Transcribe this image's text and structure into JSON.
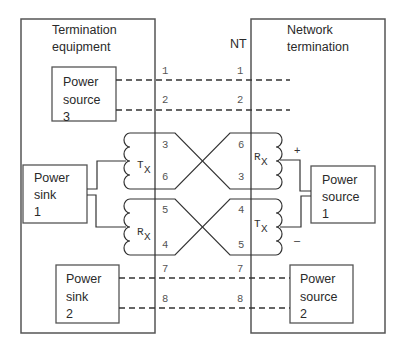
{
  "diagram": {
    "left_box": {
      "title_line1": "Termination",
      "title_line2": "equipment"
    },
    "right_box": {
      "title_line1": "Network",
      "title_line2": "termination"
    },
    "nt_label": "NT",
    "power_source_3": {
      "line1": "Power",
      "line2": "source",
      "line3": "3"
    },
    "power_sink_1": {
      "line1": "Power",
      "line2": "sink",
      "line3": "1"
    },
    "power_sink_2": {
      "line1": "Power",
      "line2": "sink",
      "line3": "2"
    },
    "power_source_1": {
      "line1": "Power",
      "line2": "source",
      "line3": "1"
    },
    "power_source_2": {
      "line1": "Power",
      "line2": "source",
      "line3": "2"
    },
    "left_pins": [
      "1",
      "2",
      "3",
      "6",
      "5",
      "4",
      "7",
      "8"
    ],
    "right_pins": [
      "1",
      "2",
      "6",
      "3",
      "4",
      "5",
      "7",
      "8"
    ],
    "coils": {
      "left_top": {
        "main": "T",
        "sub": "X"
      },
      "left_bottom": {
        "main": "R",
        "sub": "X"
      },
      "right_top": {
        "main": "R",
        "sub": "X"
      },
      "right_bottom": {
        "main": "T",
        "sub": "X"
      }
    },
    "polarity": {
      "plus": "+",
      "minus": "–"
    },
    "colors": {
      "line": "#3a3a3a",
      "box": "#555555",
      "text": "#2a2a2a"
    }
  }
}
